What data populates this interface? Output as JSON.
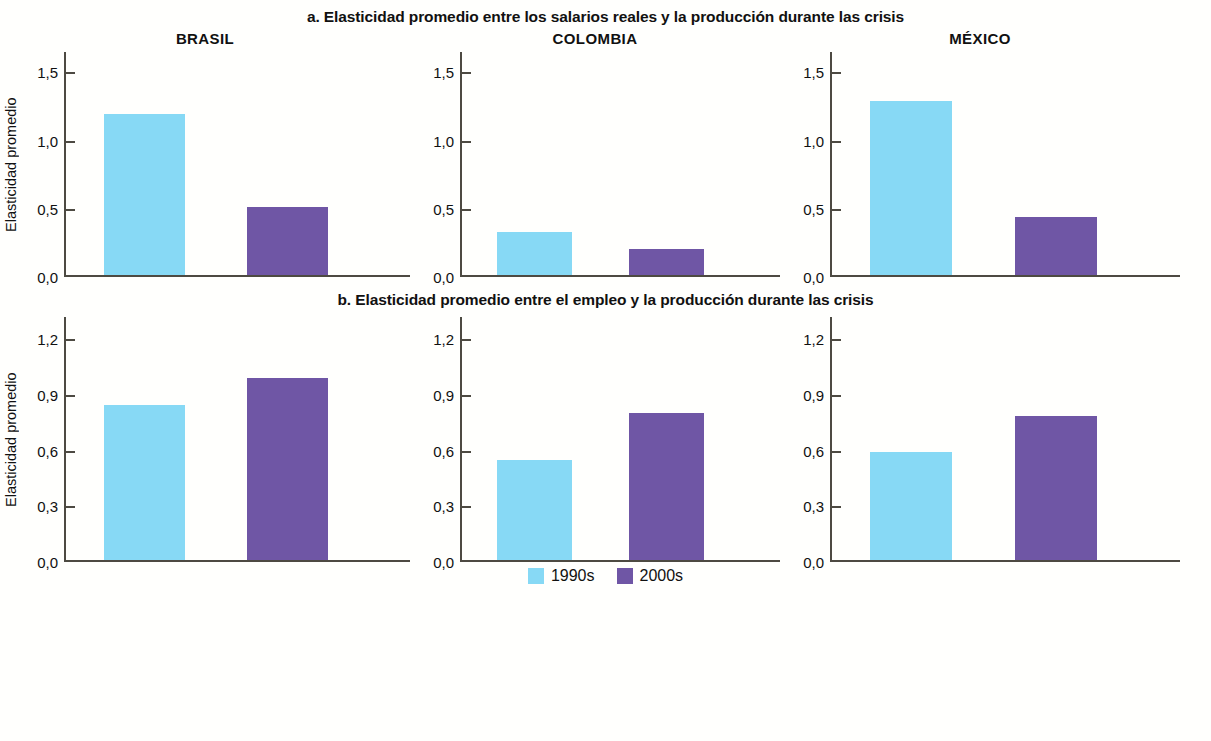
{
  "chart_data": {
    "type": "bar",
    "legend_position": "bottom-center",
    "grid": false,
    "colors": {
      "series_1990s": "#87d9f5",
      "series_2000s": "#6f56a5",
      "axis": "#4d4a42",
      "background": "#fffffd",
      "text": "#111111"
    },
    "legend": [
      {
        "name": "1990s",
        "color": "#87d9f5"
      },
      {
        "name": "2000s",
        "color": "#6f56a5"
      }
    ],
    "panels": [
      {
        "key": "a",
        "title": "a. Elasticidad promedio entre los salarios reales y la producción durante las crisis",
        "ylabel": "Elasticidad promedio",
        "xlabel": "",
        "ylim": [
          0,
          1.65
        ],
        "yticks": [
          0.0,
          0.5,
          1.0,
          1.5
        ],
        "yticklabels": [
          "0,0",
          "0,5",
          "1,0",
          "1,5"
        ],
        "categories": [
          "BRASIL",
          "COLOMBIA",
          "MÉXICO"
        ],
        "series": [
          {
            "name": "1990s",
            "values": [
              1.19,
              0.32,
              1.29
            ]
          },
          {
            "name": "2000s",
            "values": [
              0.5,
              0.19,
              0.43
            ]
          }
        ]
      },
      {
        "key": "b",
        "title": "b. Elasticidad promedio entre el empleo y la producción durante las crisis",
        "ylabel": "Elasticidad promedio",
        "xlabel": "",
        "ylim": [
          0,
          1.32
        ],
        "yticks": [
          0.0,
          0.3,
          0.6,
          0.9,
          1.2
        ],
        "yticklabels": [
          "0,0",
          "0,3",
          "0,6",
          "0,9",
          "1,2"
        ],
        "categories": [
          "BRASIL",
          "COLOMBIA",
          "MÉXICO"
        ],
        "series": [
          {
            "name": "1990s",
            "values": [
              0.84,
              0.545,
              0.585
            ]
          },
          {
            "name": "2000s",
            "values": [
              0.99,
              0.8,
              0.78
            ]
          }
        ]
      }
    ]
  }
}
